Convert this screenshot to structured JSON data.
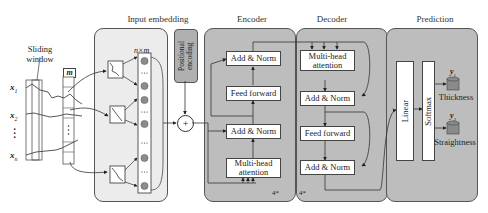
{
  "sections": {
    "input_embedding": "Input embedding",
    "encoder": "Encoder",
    "decoder": "Decoder",
    "prediction": "Prediction"
  },
  "sliding_window": {
    "label_line1": "Sliding",
    "label_line2": "window",
    "window_label": "m"
  },
  "inputs": [
    "x1",
    "x2",
    "⋮",
    "xn"
  ],
  "input_labels": {
    "x1": "x",
    "x1_sub": "1",
    "x2": "x",
    "x2_sub": "2",
    "xn": "x",
    "xn_sub": "n"
  },
  "embedding": {
    "matrix_label": "n×m"
  },
  "positional_encoding": {
    "label": "Positional encoding"
  },
  "plus_symbol": "+",
  "encoder_blocks": {
    "add_norm_top": "Add & Norm",
    "feed_forward": "Feed forward",
    "add_norm_bottom": "Add & Norm",
    "multi_head_line1": "Multi-head",
    "multi_head_line2": "attention",
    "repeat": "4*"
  },
  "decoder_blocks": {
    "multi_head_line1": "Multi-head",
    "multi_head_line2": "attention",
    "add_norm_top": "Add & Norm",
    "feed_forward": "Feed forward",
    "add_norm_bottom": "Add & Norm",
    "repeat": "4*"
  },
  "prediction_blocks": {
    "linear": "Linear",
    "softmax": "Softmax",
    "outputs": [
      {
        "symbol": "y",
        "sub": "1",
        "label": "Thickness"
      },
      {
        "symbol": "y",
        "sub": "2",
        "label": "Straightness"
      }
    ]
  },
  "colors": {
    "panel_light": "#ececec",
    "panel_dark": "#bdbdbd",
    "pos_enc": "#b0b0b0",
    "node": "#8c8c8c",
    "cylinder": "#8a8a8a"
  }
}
